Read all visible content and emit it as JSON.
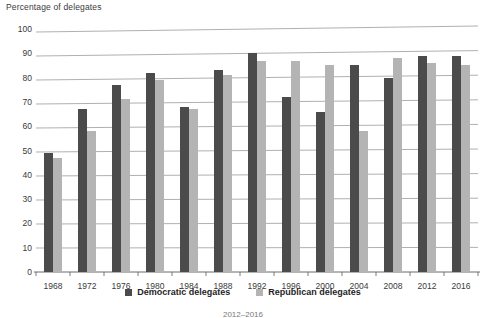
{
  "chart_data": {
    "type": "bar",
    "title": "Percentage of delegates",
    "xlabel": "",
    "ylabel": "Percentage of delegates",
    "ylim": [
      0,
      100
    ],
    "ytick_step": 10,
    "yticks": [
      "100",
      "90",
      "80",
      "70",
      "60",
      "50",
      "40",
      "30",
      "20",
      "10",
      "0"
    ],
    "grid": true,
    "legend_position": "bottom",
    "categories": [
      "1968",
      "1972",
      "1976",
      "1980",
      "1984",
      "1988",
      "1992",
      "1996",
      "2000",
      "2004",
      "2008",
      "2012",
      "2016"
    ],
    "series": [
      {
        "name": "Democratic delegates",
        "color": "#4b4b4b",
        "values": [
          49,
          67,
          77,
          82,
          68,
          83,
          90,
          72,
          66,
          85,
          80,
          89,
          89
        ]
      },
      {
        "name": "Republican delegates",
        "color": "#b4b4b4",
        "values": [
          47,
          58,
          71,
          79,
          67,
          81,
          87,
          87,
          85,
          58,
          88,
          86,
          85
        ]
      }
    ]
  },
  "legend": {
    "items": [
      {
        "label": "Democratic delegates",
        "swatch": "dem"
      },
      {
        "label": "Republican delegates",
        "swatch": "rep"
      }
    ]
  },
  "footnote": {
    "text": "2012–2016"
  }
}
